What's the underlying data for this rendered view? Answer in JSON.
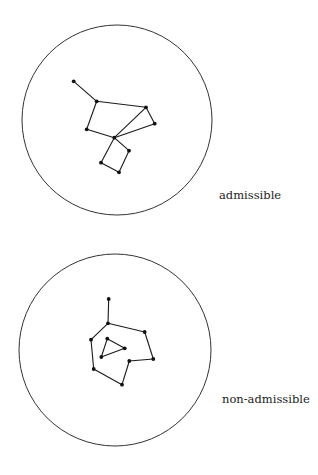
{
  "figures": [
    {
      "id": "admissible",
      "label": "admissible",
      "label_pos": {
        "x": 219,
        "y": 188
      },
      "circle": {
        "cx": 117,
        "cy": 120,
        "r": 95
      },
      "nodes": [
        {
          "x": 73.7,
          "y": 81.3
        },
        {
          "x": 96.7,
          "y": 101.3
        },
        {
          "x": 146,
          "y": 107.3
        },
        {
          "x": 154.7,
          "y": 123.7
        },
        {
          "x": 86.7,
          "y": 129.3
        },
        {
          "x": 114.3,
          "y": 137.7
        },
        {
          "x": 129,
          "y": 150.7
        },
        {
          "x": 101,
          "y": 162.7
        },
        {
          "x": 119,
          "y": 172.3
        }
      ],
      "edges": [
        [
          0,
          1
        ],
        [
          1,
          2
        ],
        [
          2,
          3
        ],
        [
          3,
          5
        ],
        [
          2,
          5
        ],
        [
          1,
          4
        ],
        [
          4,
          5
        ],
        [
          5,
          6
        ],
        [
          6,
          8
        ],
        [
          8,
          7
        ],
        [
          7,
          5
        ]
      ]
    },
    {
      "id": "non-admissible",
      "label": "non-admissible",
      "label_pos": {
        "x": 222,
        "y": 392
      },
      "circle": {
        "cx": 115,
        "cy": 350,
        "r": 96
      },
      "nodes": [
        {
          "x": 108.7,
          "y": 299
        },
        {
          "x": 108,
          "y": 323.3
        },
        {
          "x": 144.7,
          "y": 332
        },
        {
          "x": 153.3,
          "y": 359
        },
        {
          "x": 129.3,
          "y": 361
        },
        {
          "x": 122,
          "y": 384.7
        },
        {
          "x": 93.7,
          "y": 369
        },
        {
          "x": 91,
          "y": 339.7
        },
        {
          "x": 107.3,
          "y": 338.7
        },
        {
          "x": 124.7,
          "y": 348.3
        },
        {
          "x": 101.3,
          "y": 357
        }
      ],
      "edges": [
        [
          0,
          1
        ],
        [
          1,
          2
        ],
        [
          2,
          3
        ],
        [
          3,
          4
        ],
        [
          4,
          5
        ],
        [
          5,
          6
        ],
        [
          6,
          7
        ],
        [
          7,
          1
        ],
        [
          8,
          9
        ],
        [
          9,
          10
        ],
        [
          10,
          8
        ]
      ]
    }
  ],
  "style": {
    "stroke_color": "#1a1a1a",
    "node_color": "#111111",
    "circle_color": "#333333",
    "background": "#ffffff"
  }
}
